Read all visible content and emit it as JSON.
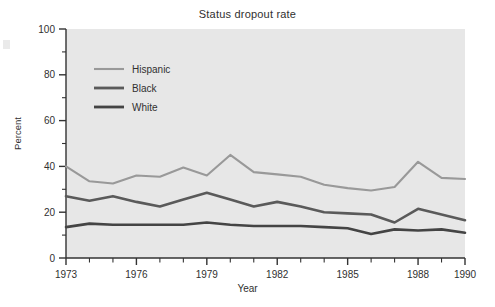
{
  "chart_data": {
    "type": "line",
    "title": "Status dropout rate",
    "xlabel": "Year",
    "ylabel": "Percent",
    "xlim": [
      1973,
      1990
    ],
    "ylim": [
      0,
      100
    ],
    "grid": false,
    "legend_position": "upper-left-inside",
    "x": [
      1973,
      1974,
      1975,
      1976,
      1977,
      1978,
      1979,
      1980,
      1981,
      1982,
      1983,
      1984,
      1985,
      1986,
      1987,
      1988,
      1989,
      1990
    ],
    "xticks_labeled": [
      "1973",
      "1976",
      "1979",
      "1982",
      "1985",
      "1988",
      "1990"
    ],
    "yticks_labeled": [
      "0",
      "20",
      "40",
      "60",
      "80",
      "100"
    ],
    "yticks_minor": [
      10,
      30,
      50,
      70,
      90
    ],
    "series": [
      {
        "name": "Hispanic",
        "color": "#999999",
        "values": [
          40.0,
          33.5,
          32.5,
          36.0,
          35.5,
          39.5,
          36.0,
          45.0,
          37.5,
          36.5,
          35.5,
          32.0,
          30.5,
          29.5,
          31.0,
          42.0,
          35.0,
          34.5
        ]
      },
      {
        "name": "Black",
        "color": "#5a5a5a",
        "values": [
          27.0,
          25.0,
          27.0,
          24.5,
          22.5,
          25.5,
          28.5,
          25.5,
          22.5,
          24.5,
          22.5,
          20.0,
          19.5,
          19.0,
          15.5,
          21.5,
          19.0,
          16.5
        ]
      },
      {
        "name": "White",
        "color": "#444444",
        "values": [
          13.5,
          15.0,
          14.5,
          14.5,
          14.5,
          14.5,
          15.5,
          14.5,
          14.0,
          14.0,
          14.0,
          13.5,
          13.0,
          10.5,
          12.5,
          12.0,
          12.5,
          11.0
        ]
      }
    ]
  },
  "figure": {
    "title": "Status dropout rate",
    "xlabel": "Year",
    "ylabel": "Percent",
    "legend": [
      {
        "label": "Hispanic",
        "color": "#999999"
      },
      {
        "label": "Black",
        "color": "#5a5a5a"
      },
      {
        "label": "White",
        "color": "#444444"
      }
    ],
    "yticks": [
      "100",
      "80",
      "60",
      "40",
      "20",
      "0"
    ],
    "xticks": [
      "1973",
      "1976",
      "1979",
      "1982",
      "1985",
      "1988",
      "1990"
    ],
    "colors": {
      "plot_background": "#e7e7e7",
      "page_background": "#ffffff",
      "axis": "#333333",
      "text": "#303030"
    }
  }
}
